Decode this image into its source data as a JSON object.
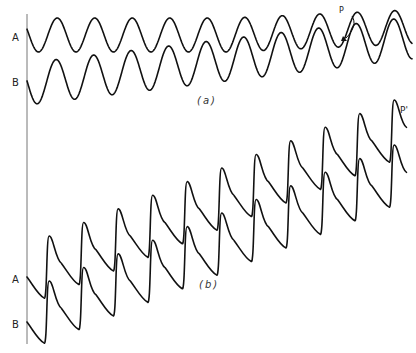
{
  "figure": {
    "panel_a": {
      "caption": "(a)",
      "wave_labels": [
        "A",
        "B"
      ],
      "annotation": "P"
    },
    "panel_b": {
      "caption": "(b)",
      "wave_labels": [
        "A",
        "B"
      ],
      "annotation": "P'"
    }
  }
}
